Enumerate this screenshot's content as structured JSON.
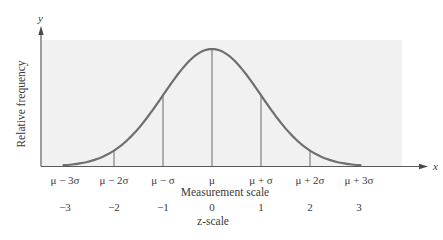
{
  "chart_data": {
    "type": "line",
    "title": "",
    "x_axis_symbol": "x",
    "y_axis_symbol": "y",
    "ylabel": "Relative frequency",
    "xlabel": "Measurement scale",
    "secondary_xlabel": "z-scale",
    "categories": [
      "μ − 3σ",
      "μ − 2σ",
      "μ − σ",
      "μ",
      "μ + σ",
      "μ + 2σ",
      "μ + 3σ"
    ],
    "z_values": [
      "−3",
      "−2",
      "−1",
      "0",
      "1",
      "2",
      "3"
    ],
    "x": [
      -3,
      -2,
      -1,
      0,
      1,
      2,
      3
    ],
    "series": [
      {
        "name": "Normal density (relative)",
        "values": [
          0.011,
          0.135,
          0.607,
          1.0,
          0.607,
          0.135,
          0.011
        ]
      }
    ],
    "vertical_lines_at_z": [
      -2,
      -1,
      0,
      1,
      2
    ],
    "xlim": [
      -3.5,
      4.3
    ],
    "ylim": [
      0,
      1.1
    ],
    "grid": false,
    "legend": "none",
    "background_panel": true
  },
  "colors": {
    "curve": "#6e6e6e",
    "axis": "#5a5a5a",
    "panel": "#f1f1f1",
    "text": "#3a3a3a"
  }
}
